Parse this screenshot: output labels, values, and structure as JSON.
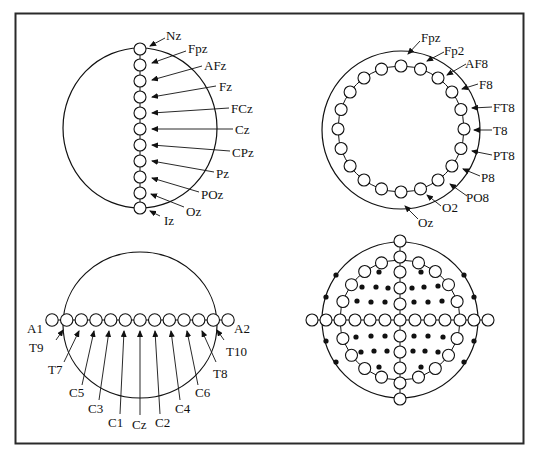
{
  "figure": {
    "title": "",
    "panels": [
      {
        "id": "sagittal-midline",
        "description": "Midline electrode chain from nasion to inion",
        "labels": [
          "Nz",
          "Fpz",
          "AFz",
          "Fz",
          "FCz",
          "Cz",
          "CPz",
          "Pz",
          "POz",
          "Oz",
          "Iz"
        ]
      },
      {
        "id": "circumferential-ring",
        "description": "Circumferential electrode ring (right hemisphere labeled)",
        "labels": [
          "Fpz",
          "Fp2",
          "AF8",
          "F8",
          "FT8",
          "T8",
          "PT8",
          "P8",
          "PO8",
          "O2",
          "Oz"
        ]
      },
      {
        "id": "coronal-central",
        "description": "Central coronal electrode chain from A1 to A2",
        "labels": [
          "A1",
          "T9",
          "T7",
          "C5",
          "C3",
          "C1",
          "Cz",
          "C2",
          "C4",
          "C6",
          "T8",
          "T10",
          "A2"
        ]
      },
      {
        "id": "top-view-montage",
        "description": "Top view of full 10-10 montage with open circles and filled dots",
        "legend": {
          "open_circle": "labeled electrode position",
          "filled_dot": "additional electrode position"
        }
      }
    ]
  },
  "colors": {
    "line": "#111111",
    "frame": "#2a2a2a",
    "background": "#ffffff"
  }
}
